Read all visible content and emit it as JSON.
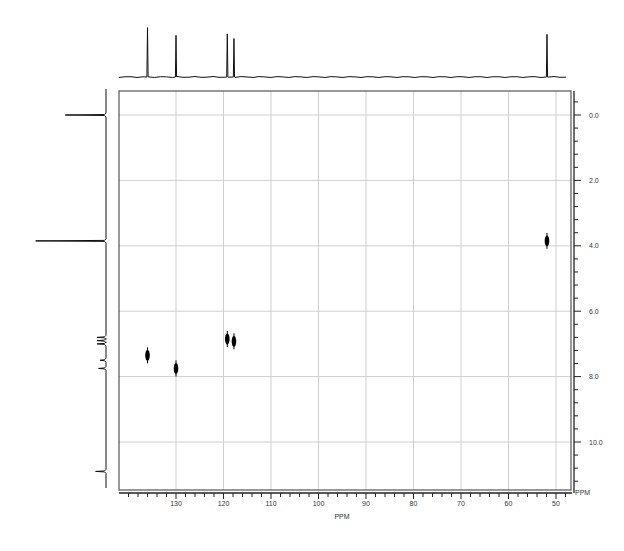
{
  "chart_data": {
    "type": "heatmap",
    "subtype": "2D NMR correlation (HSQC-style contour plot)",
    "title": "",
    "xlabel": "PPM",
    "ylabel": "PPM",
    "x_axis": {
      "label": "PPM",
      "range": [
        140,
        47
      ],
      "reversed": true,
      "ticks": [
        130,
        120,
        110,
        100,
        90,
        80,
        70,
        60,
        50
      ],
      "tick_labels": [
        "130",
        "120",
        "110",
        "100",
        "90",
        "80",
        "70",
        "60",
        "50"
      ],
      "minor_tick_step": 2
    },
    "y_axis": {
      "label": "PPM",
      "position": "right",
      "range": [
        -0.8,
        11.4
      ],
      "reversed": true,
      "ticks": [
        0.0,
        2.0,
        4.0,
        6.0,
        8.0,
        10.0
      ],
      "tick_labels": [
        "0.0",
        "2.0",
        "4.0",
        "6.0",
        "8.0",
        "10.0"
      ],
      "minor_tick_step": 0.4
    },
    "grid": true,
    "cross_peaks": [
      {
        "x": 136.0,
        "y": 7.35
      },
      {
        "x": 130.0,
        "y": 7.75
      },
      {
        "x": 119.2,
        "y": 6.85
      },
      {
        "x": 117.8,
        "y": 6.92
      },
      {
        "x": 51.9,
        "y": 3.85
      }
    ],
    "top_projection": {
      "description": "1D 13C spectrum along x axis",
      "peaks": [
        {
          "x": 136.0,
          "height": 0.95
        },
        {
          "x": 130.0,
          "height": 0.8
        },
        {
          "x": 119.2,
          "height": 0.83
        },
        {
          "x": 117.8,
          "height": 0.74
        },
        {
          "x": 51.9,
          "height": 0.82
        }
      ]
    },
    "left_projection": {
      "description": "1D 1H spectrum along y axis",
      "peaks": [
        {
          "y": 0.0,
          "height": 0.55
        },
        {
          "y": 3.85,
          "height": 0.95
        },
        {
          "y": 6.8,
          "height": 0.12
        },
        {
          "y": 6.9,
          "height": 0.12
        },
        {
          "y": 7.0,
          "height": 0.12
        },
        {
          "y": 7.5,
          "height": 0.08
        },
        {
          "y": 7.75,
          "height": 0.1
        },
        {
          "y": 10.9,
          "height": 0.14
        }
      ]
    }
  },
  "axes": {
    "x_label": "PPM",
    "y_corner_label": "PPM"
  },
  "colors": {
    "trace": "#111111",
    "frame": "#555555",
    "grid": "#cfcfcf",
    "peak": "#000000",
    "background": "#ffffff"
  }
}
